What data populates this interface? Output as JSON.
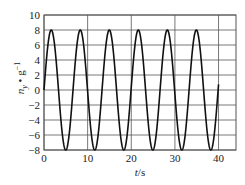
{
  "chart_data": {
    "type": "line",
    "title": "",
    "xlabel": "t/s",
    "ylabel": "n_y • g⁻¹",
    "xlim": [
      0,
      44
    ],
    "ylim": [
      -8,
      10
    ],
    "xticks": [
      0,
      10,
      20,
      30,
      40
    ],
    "yticks": [
      -8,
      -6,
      -4,
      -2,
      0,
      2,
      4,
      6,
      8,
      10
    ],
    "xtick_labels": [
      "0",
      "10",
      "20",
      "30",
      "40"
    ],
    "ytick_labels": [
      "−8",
      "−6",
      "−4",
      "−2",
      "0",
      "2",
      "4",
      "6",
      "8",
      "10"
    ],
    "grid": true,
    "legend": null,
    "series": [
      {
        "name": "n_y/g",
        "description": "sinusoid, amplitude ≈ 8, period ≈ 6.65 s, starts at 0 rising, t from 0 to 40 s",
        "amplitude": 8,
        "period": 6.65,
        "t_start": 0,
        "t_end": 40,
        "x": [
          0,
          1.66,
          3.33,
          4.99,
          6.65,
          8.31,
          9.98,
          11.64,
          13.3,
          14.96,
          16.63,
          18.29,
          19.95,
          21.61,
          23.28,
          24.94,
          26.6,
          28.26,
          29.93,
          31.59,
          33.25,
          34.91,
          36.58,
          38.24,
          39.9,
          40
        ],
        "values": [
          0,
          8,
          0,
          -8,
          0,
          8,
          0,
          -8,
          0,
          8,
          0,
          -8,
          0,
          8,
          0,
          -8,
          0,
          8,
          0,
          -8,
          0,
          8,
          0,
          -8,
          0,
          0.8
        ]
      }
    ]
  },
  "axes": {
    "x_label_main": "t",
    "x_label_unit": "/s",
    "y_label_main": "n",
    "y_label_sub": "y",
    "y_label_rest": " • g",
    "y_label_sup": "−1"
  },
  "colors": {
    "line": "#111111",
    "grid": "#555555",
    "frame": "#555555"
  }
}
